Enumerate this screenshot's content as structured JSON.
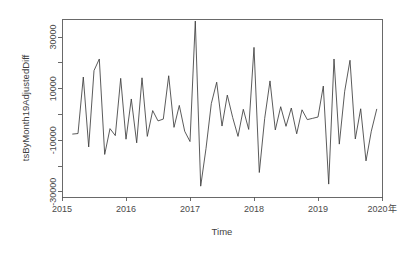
{
  "figure": {
    "background": "#ffffff",
    "line_color": "#3d3d3d",
    "axis_color": "#595959"
  },
  "chart_data": {
    "type": "line",
    "title": "",
    "subtitle": "",
    "xlabel": "Time",
    "ylabel": "tsByMonth19AdjustedDiff",
    "xlim": [
      2015.0,
      2020.0
    ],
    "ylim": [
      -32000,
      37000
    ],
    "grid": false,
    "legend": "none",
    "x_tick_labels": [
      "2015",
      "2016",
      "2017",
      "2018",
      "2019",
      "2020年"
    ],
    "x_tick_values": [
      2015,
      2016,
      2017,
      2018,
      2019,
      2020
    ],
    "y_tick_labels": [
      "-30000",
      "-10000",
      "10000",
      "30000"
    ],
    "y_tick_values": [
      -30000,
      -10000,
      10000,
      30000
    ],
    "y_minor_ticks": [
      -20000,
      0,
      20000
    ],
    "series": [
      {
        "name": "tsByMonth19AdjustedDiff",
        "x": [
          2015.167,
          2015.25,
          2015.333,
          2015.417,
          2015.5,
          2015.583,
          2015.667,
          2015.75,
          2015.833,
          2015.917,
          2016.0,
          2016.083,
          2016.167,
          2016.25,
          2016.333,
          2016.417,
          2016.5,
          2016.583,
          2016.667,
          2016.75,
          2016.833,
          2016.917,
          2017.0,
          2017.083,
          2017.167,
          2017.25,
          2017.333,
          2017.417,
          2017.5,
          2017.583,
          2017.667,
          2017.75,
          2017.833,
          2017.917,
          2018.0,
          2018.083,
          2018.167,
          2018.25,
          2018.333,
          2018.417,
          2018.5,
          2018.583,
          2018.667,
          2018.75,
          2018.833,
          2018.917,
          2019.0,
          2019.083,
          2019.167,
          2019.25,
          2019.333,
          2019.417,
          2019.5,
          2019.583,
          2019.667,
          2019.75,
          2019.833,
          2019.917
        ],
        "values": [
          -7600,
          -7400,
          14500,
          -12600,
          17000,
          21500,
          -15500,
          -5500,
          -8200,
          14000,
          -9600,
          6000,
          -11000,
          14200,
          -8500,
          1500,
          -2500,
          -1800,
          15000,
          -5000,
          3500,
          -6500,
          -10500,
          36200,
          -27800,
          -13200,
          4200,
          12500,
          -4500,
          7500,
          -1200,
          -8500,
          2000,
          -5800,
          26000,
          -22500,
          -1500,
          13000,
          -6000,
          3000,
          -4600,
          2500,
          -7500,
          1800,
          -2000,
          -1500,
          -1000,
          11000,
          -27000,
          21500,
          -11500,
          9000,
          21000,
          -9500,
          2200,
          -18000,
          -6500,
          2000
        ]
      }
    ]
  },
  "axis": {
    "y_title": "tsByMonth19AdjustedDiff",
    "x_title": "Time"
  }
}
